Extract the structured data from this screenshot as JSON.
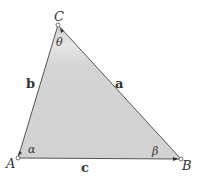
{
  "diagram": {
    "type": "triangle",
    "fill_color": "#d6d6d6",
    "stroke_color": "#555555",
    "vertices": [
      {
        "label": "A",
        "x": 18,
        "y": 158
      },
      {
        "label": "B",
        "x": 181,
        "y": 159
      },
      {
        "label": "C",
        "x": 58,
        "y": 25
      }
    ],
    "sides": [
      {
        "label": "a",
        "between": "B-C"
      },
      {
        "label": "b",
        "between": "A-C"
      },
      {
        "label": "c",
        "between": "A-B"
      }
    ],
    "angles": [
      {
        "label": "α",
        "vertex": "A"
      },
      {
        "label": "β",
        "vertex": "B"
      },
      {
        "label": "θ",
        "vertex": "C"
      }
    ]
  }
}
